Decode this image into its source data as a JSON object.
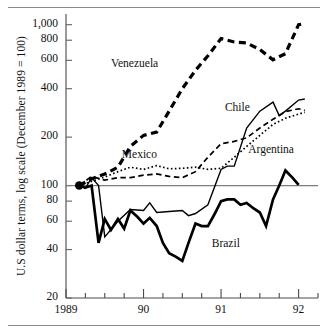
{
  "chart_data": {
    "type": "line",
    "title": "",
    "subtitle": "",
    "xlabel": "",
    "ylabel": "U.S dollar terms, log scale (December 1989 = 100)",
    "yscale": "log",
    "ylim": [
      20,
      1100
    ],
    "xlim": [
      1989.0,
      1992.25
    ],
    "grid": false,
    "legend_position": "inline-annotations",
    "baseline": {
      "value": 100,
      "label": "100",
      "note": "December 1989 = 100 reference line"
    },
    "origin_marker": {
      "x": 1989.17,
      "y": 100,
      "shape": "filled-circle"
    },
    "yticks": [
      20,
      40,
      60,
      80,
      100,
      200,
      400,
      600,
      800,
      1000
    ],
    "ytick_labels": [
      "20",
      "40",
      "60",
      "80",
      "100",
      "200",
      "400",
      "600",
      "800",
      "1,000"
    ],
    "xticks": [
      1989,
      1990,
      1991,
      1992
    ],
    "xtick_labels": [
      "1989",
      "90",
      "91",
      "92"
    ],
    "xminor_interval_months": 3,
    "series": [
      {
        "name": "Venezuela",
        "style": "thick-dashed",
        "color": "#000000",
        "label_x": 1989.58,
        "label_y": 560,
        "x": [
          1989.17,
          1989.33,
          1989.5,
          1989.67,
          1989.83,
          1990.0,
          1990.17,
          1990.33,
          1990.5,
          1990.67,
          1990.83,
          1991.0,
          1991.17,
          1991.33,
          1991.5,
          1991.67,
          1991.83,
          1992.0,
          1992.08
        ],
        "values": [
          100,
          110,
          118,
          130,
          175,
          205,
          215,
          290,
          400,
          520,
          640,
          820,
          780,
          770,
          700,
          605,
          660,
          1000,
          1015
        ]
      },
      {
        "name": "Mexico",
        "style": "dotted",
        "color": "#000000",
        "label_x": 1989.72,
        "label_y": 152,
        "x": [
          1989.17,
          1989.33,
          1989.5,
          1989.67,
          1989.83,
          1990.0,
          1990.17,
          1990.33,
          1990.5,
          1990.67,
          1990.83,
          1991.0,
          1991.17,
          1991.33,
          1991.5,
          1991.67,
          1991.83,
          1992.0,
          1992.08
        ],
        "values": [
          100,
          106,
          113,
          122,
          130,
          126,
          133,
          127,
          128,
          130,
          126,
          128,
          150,
          175,
          205,
          240,
          262,
          278,
          285
        ]
      },
      {
        "name": "Chile",
        "style": "dashed",
        "color": "#000000",
        "label_x": 1991.05,
        "label_y": 300,
        "x": [
          1989.17,
          1989.33,
          1989.5,
          1989.67,
          1989.83,
          1990.0,
          1990.17,
          1990.33,
          1990.5,
          1990.67,
          1990.83,
          1991.0,
          1991.17,
          1991.33,
          1991.5,
          1991.67,
          1991.83,
          1992.0,
          1992.08
        ],
        "values": [
          100,
          114,
          108,
          112,
          112,
          116,
          118,
          114,
          112,
          122,
          150,
          182,
          188,
          198,
          228,
          258,
          288,
          300,
          293
        ]
      },
      {
        "name": "Argentina",
        "style": "thin-solid",
        "color": "#000000",
        "label_x": 1991.35,
        "label_y": 163,
        "x": [
          1989.17,
          1989.25,
          1989.33,
          1989.42,
          1989.5,
          1989.67,
          1989.83,
          1990.0,
          1990.08,
          1990.17,
          1990.33,
          1990.5,
          1990.58,
          1990.67,
          1990.83,
          1991.0,
          1991.08,
          1991.17,
          1991.33,
          1991.5,
          1991.67,
          1991.75,
          1991.83,
          1992.0,
          1992.08
        ],
        "values": [
          100,
          96,
          112,
          100,
          48,
          60,
          71,
          70,
          78,
          68,
          69,
          70,
          65,
          67,
          76,
          126,
          132,
          132,
          228,
          290,
          330,
          272,
          290,
          340,
          345
        ]
      },
      {
        "name": "Brazil",
        "style": "thick-solid",
        "color": "#000000",
        "label_x": 1990.88,
        "label_y": 43,
        "x": [
          1989.17,
          1989.25,
          1989.33,
          1989.42,
          1989.5,
          1989.58,
          1989.67,
          1989.75,
          1989.83,
          1989.92,
          1990.0,
          1990.08,
          1990.17,
          1990.25,
          1990.33,
          1990.42,
          1990.5,
          1990.58,
          1990.67,
          1990.75,
          1990.83,
          1990.92,
          1991.0,
          1991.08,
          1991.17,
          1991.25,
          1991.33,
          1991.42,
          1991.5,
          1991.58,
          1991.67,
          1991.75,
          1991.83,
          1991.92,
          1992.0
        ],
        "values": [
          100,
          97,
          100,
          44,
          62,
          53,
          62,
          54,
          70,
          64,
          58,
          63,
          56,
          44,
          38,
          36,
          34,
          44,
          58,
          56,
          56,
          67,
          80,
          82,
          82,
          76,
          78,
          72,
          68,
          56,
          82,
          100,
          124,
          112,
          101
        ]
      }
    ]
  }
}
